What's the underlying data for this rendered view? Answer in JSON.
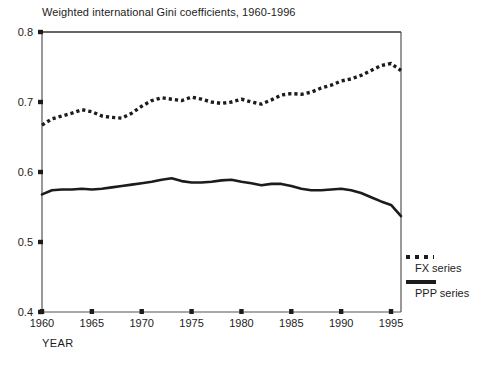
{
  "chart_data": {
    "type": "line",
    "title": "Weighted international Gini coefficients, 1960-1996",
    "xlabel": "YEAR",
    "ylabel": "",
    "xlim": [
      1960,
      1996
    ],
    "ylim": [
      0.4,
      0.8
    ],
    "grid": false,
    "legend_position": "right-bottom-outside",
    "yticks": [
      "0.4",
      "0.5",
      "0.6",
      "0.7",
      "0.8"
    ],
    "ytick_values": [
      0.4,
      0.5,
      0.6,
      0.7,
      0.8
    ],
    "xticks": [
      "1960",
      "1965",
      "1970",
      "1975",
      "1980",
      "1985",
      "1990",
      "1995"
    ],
    "xtick_values": [
      1960,
      1965,
      1970,
      1975,
      1980,
      1985,
      1990,
      1995
    ],
    "x": [
      1960,
      1961,
      1962,
      1963,
      1964,
      1965,
      1966,
      1967,
      1968,
      1969,
      1970,
      1971,
      1972,
      1973,
      1974,
      1975,
      1976,
      1977,
      1978,
      1979,
      1980,
      1981,
      1982,
      1983,
      1984,
      1985,
      1986,
      1987,
      1988,
      1989,
      1990,
      1991,
      1992,
      1993,
      1994,
      1995,
      1996
    ],
    "series": [
      {
        "name": "FX series",
        "style": "dotted",
        "color": "#1c1c1c",
        "values": [
          0.667,
          0.676,
          0.68,
          0.684,
          0.689,
          0.686,
          0.68,
          0.678,
          0.677,
          0.684,
          0.694,
          0.702,
          0.706,
          0.704,
          0.702,
          0.707,
          0.704,
          0.7,
          0.698,
          0.7,
          0.704,
          0.7,
          0.697,
          0.703,
          0.71,
          0.712,
          0.711,
          0.714,
          0.72,
          0.724,
          0.73,
          0.733,
          0.738,
          0.745,
          0.752,
          0.755,
          0.745
        ]
      },
      {
        "name": "PPP series",
        "style": "solid",
        "color": "#1c1c1c",
        "values": [
          0.568,
          0.574,
          0.575,
          0.575,
          0.576,
          0.575,
          0.576,
          0.578,
          0.58,
          0.582,
          0.584,
          0.586,
          0.589,
          0.591,
          0.587,
          0.585,
          0.585,
          0.586,
          0.588,
          0.589,
          0.586,
          0.584,
          0.581,
          0.583,
          0.583,
          0.58,
          0.576,
          0.574,
          0.574,
          0.575,
          0.576,
          0.574,
          0.57,
          0.564,
          0.558,
          0.553,
          0.537
        ]
      }
    ]
  },
  "legend": {
    "entries": [
      {
        "label": "FX series",
        "icon": "dotted-line-swatch"
      },
      {
        "label": "PPP series",
        "icon": "solid-line-swatch"
      }
    ]
  }
}
